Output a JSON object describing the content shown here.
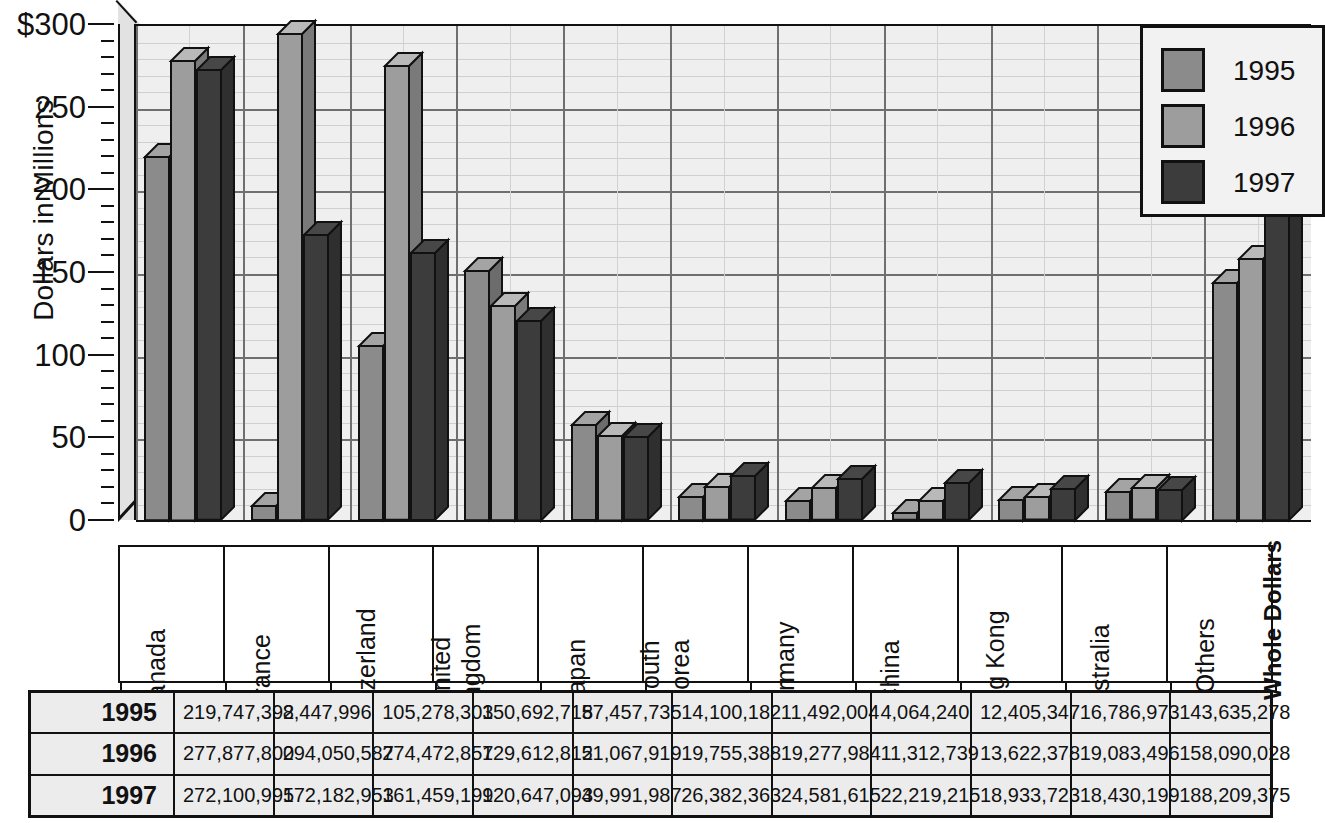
{
  "chart_data": {
    "type": "bar",
    "title": "",
    "xlabel": "",
    "ylabel": "Dollars in Millions",
    "ylim": [
      0,
      300
    ],
    "ytick_labels": [
      "$300",
      "250",
      "200",
      "150",
      "100",
      "50",
      "0"
    ],
    "ytick_values": [
      300,
      250,
      200,
      150,
      100,
      50,
      0
    ],
    "minor_tick_step": 10,
    "grid": true,
    "legend_position": "top-right",
    "value_units": "Whole Dollars",
    "categories": [
      "Canada",
      "France",
      "Switzerland",
      "United Kingdom",
      "Japan",
      "South Korea",
      "Germany",
      "China",
      "Hong Kong",
      "Australia",
      "All Others"
    ],
    "category_lines": [
      [
        "Canada"
      ],
      [
        "France"
      ],
      [
        "Switzerland"
      ],
      [
        "United",
        "Kingdom"
      ],
      [
        "Japan"
      ],
      [
        "South",
        "Korea"
      ],
      [
        "Germany"
      ],
      [
        "China"
      ],
      [
        "Hong Kong"
      ],
      [
        "Australia"
      ],
      [
        "All Others"
      ]
    ],
    "series": [
      {
        "name": "1995",
        "color": "#8b8b8b",
        "values": [
          219.747392,
          8.447996,
          105.278303,
          150.692718,
          57.457735,
          14.100182,
          11.492004,
          4.06424,
          12.405347,
          16.786973,
          143.635278
        ],
        "labels": [
          "219,747,392",
          "8,447,996",
          "105,278,303",
          "150,692,718",
          "57,457,735",
          "14,100,182",
          "11,492,004",
          "4,064,240",
          "12,405,347",
          "16,786,973",
          "143,635,278"
        ]
      },
      {
        "name": "1996",
        "color": "#9d9d9d",
        "values": [
          277.8778,
          294.050587,
          274.472857,
          129.612812,
          51.067919,
          19.755388,
          19.277984,
          11.312739,
          13.622378,
          19.083496,
          158.090028
        ],
        "labels": [
          "277,877,800",
          "294,050,587",
          "274,472,857",
          "129,612,812",
          "51,067,919",
          "19,755,388",
          "19,277,984",
          "11,312,739",
          "13,622,378",
          "19,083,496",
          "158,090,028"
        ]
      },
      {
        "name": "1997",
        "color": "#3c3c3c",
        "values": [
          272.100995,
          172.182953,
          161.459199,
          120.647093,
          49.991987,
          26.382363,
          24.581615,
          22.219215,
          18.933723,
          18.430199,
          188.209375
        ],
        "labels": [
          "272,100,995",
          "172,182,953",
          "161,459,199",
          "120,647,093",
          "49,991,987",
          "26,382,363",
          "24,581,615",
          "22,219,215",
          "18,933,723",
          "18,430,199",
          "188,209,375"
        ]
      }
    ]
  },
  "legend": {
    "items": [
      {
        "label": "1995",
        "color": "#8b8b8b"
      },
      {
        "label": "1996",
        "color": "#9d9d9d"
      },
      {
        "label": "1997",
        "color": "#3c3c3c"
      }
    ]
  },
  "table": {
    "row_headers": [
      "1995",
      "1996",
      "1997"
    ],
    "unit_label": "Whole Dollars",
    "rows": [
      [
        "219,747,392",
        "8,447,996",
        "105,278,303",
        "150,692,718",
        "57,457,735",
        "14,100,182",
        "11,492,004",
        "4,064,240",
        "12,405,347",
        "16,786,973",
        "143,635,278"
      ],
      [
        "277,877,800",
        "294,050,587",
        "274,472,857",
        "129,612,812",
        "51,067,919",
        "19,755,388",
        "19,277,984",
        "11,312,739",
        "13,622,378",
        "19,083,496",
        "158,090,028"
      ],
      [
        "272,100,995",
        "172,182,953",
        "161,459,199",
        "120,647,093",
        "49,991,987",
        "26,382,363",
        "24,581,615",
        "22,219,215",
        "18,933,723",
        "18,430,199",
        "188,209,375"
      ]
    ]
  },
  "axis": {
    "title": "Dollars in Millions"
  },
  "colors": {
    "panel": "#efefef",
    "grid_major": "#6f6f6f",
    "grid_minor": "#cfcfcf",
    "outline": "#111111",
    "series_1995": "#8b8b8b",
    "series_1996": "#9d9d9d",
    "series_1997": "#3c3c3c"
  }
}
